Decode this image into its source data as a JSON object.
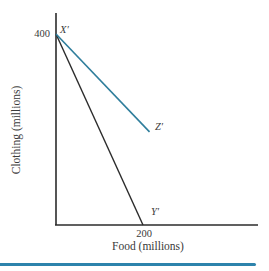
{
  "figure": {
    "background": "#ffffff",
    "bottom_rule_color": "#2d83ac"
  },
  "chart_data": {
    "type": "line",
    "title": "",
    "xlabel": "Food (millions)",
    "ylabel": "Clothing (millions)",
    "axis_color": "#2b2b2b",
    "grid": false,
    "legend": "none",
    "xlim": [
      0,
      464
    ],
    "ylim": [
      0,
      444
    ],
    "x_ticks": [
      {
        "value": 200,
        "label": "200"
      }
    ],
    "y_ticks": [
      {
        "value": 400,
        "label": "400"
      }
    ],
    "series": [
      {
        "name": "line-x-to-y",
        "color": "#2b2b2b",
        "width": 1.4,
        "points": [
          [
            0,
            400
          ],
          [
            200,
            0
          ]
        ]
      },
      {
        "name": "line-x-to-z",
        "color": "#2f7e9c",
        "width": 1.6,
        "points": [
          [
            0,
            400
          ],
          [
            215,
            195
          ]
        ]
      }
    ],
    "point_labels": [
      {
        "text": "X′",
        "at": [
          0,
          400
        ]
      },
      {
        "text": "Z′",
        "at": [
          215,
          195
        ]
      },
      {
        "text": "Y′",
        "at": [
          200,
          0
        ]
      }
    ]
  }
}
